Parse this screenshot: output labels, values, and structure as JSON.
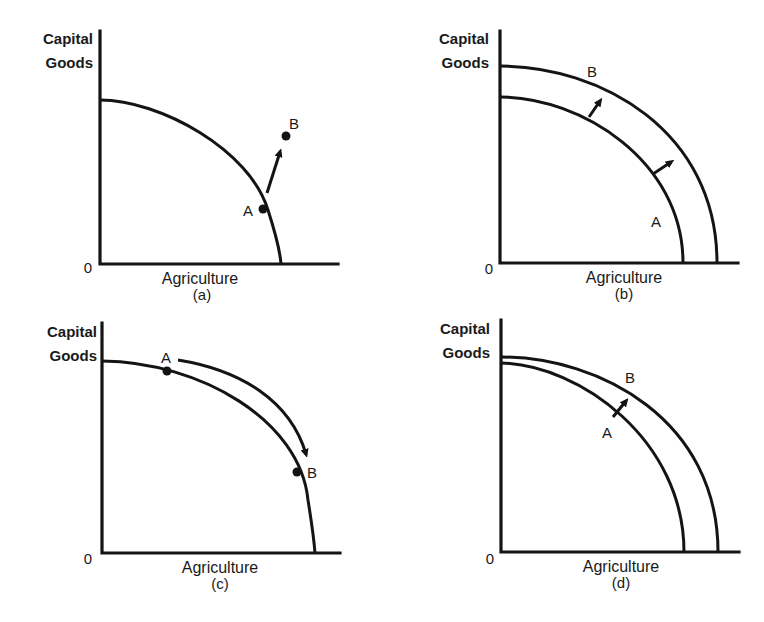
{
  "figure": {
    "panels": [
      {
        "id": "a",
        "ylabel_line1": "Capital",
        "ylabel_line2": "Goods",
        "xlabel": "Agriculture",
        "caption": "(a)",
        "origin": "0",
        "point_a": "A",
        "point_b": "B",
        "description": "Single PPF; point A on curve, arrow to point B outside curve"
      },
      {
        "id": "b",
        "ylabel_line1": "Capital",
        "ylabel_line2": "Goods",
        "xlabel": "Agriculture",
        "caption": "(b)",
        "origin": "0",
        "curve_a": "A",
        "curve_b": "B",
        "description": "PPF A shifts outward in parallel to PPF B (two arrows)"
      },
      {
        "id": "c",
        "ylabel_line1": "Capital",
        "ylabel_line2": "Goods",
        "xlabel": "Agriculture",
        "caption": "(c)",
        "origin": "0",
        "point_a": "A",
        "point_b": "B",
        "description": "Movement along single PPF from A to B"
      },
      {
        "id": "d",
        "ylabel_line1": "Capital",
        "ylabel_line2": "Goods",
        "xlabel": "Agriculture",
        "caption": "(d)",
        "origin": "0",
        "point_a": "A",
        "point_b": "B",
        "description": "PPF shifts outward, mostly along agriculture axis; arrow from A to B"
      }
    ]
  },
  "colors": {
    "ink": "#141414",
    "background": "#ffffff"
  }
}
